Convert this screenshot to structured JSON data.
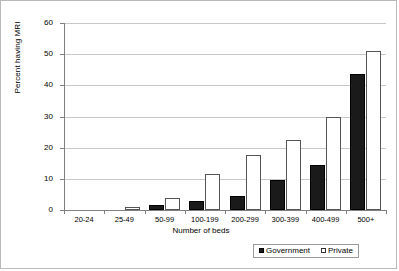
{
  "chart_data": {
    "type": "bar",
    "title": "",
    "xlabel": "Number of beds",
    "ylabel": "Percent having MRI",
    "categories": [
      "20-24",
      "25-49",
      "50-99",
      "100-199",
      "200-299",
      "300-399",
      "400-499",
      "500+"
    ],
    "series": [
      {
        "name": "Government",
        "values": [
          0,
          0,
          1.5,
          3,
          4.5,
          9.5,
          14.5,
          43.5
        ],
        "color": "#1a1a1a",
        "fill": "solid-black"
      },
      {
        "name": "Private",
        "values": [
          0,
          1,
          4,
          11.5,
          17.5,
          22.5,
          30,
          51
        ],
        "color": "#ffffff",
        "fill": "white-outlined"
      }
    ],
    "ylim": [
      0,
      60
    ],
    "yticks": [
      0,
      10,
      20,
      30,
      40,
      50,
      60
    ],
    "ytick_labels": [
      "0",
      "10",
      "20",
      "30",
      "40",
      "50",
      "60"
    ],
    "grid": "horizontal",
    "legend_position": "bottom-right",
    "legend_entries": [
      "Government",
      "Private"
    ]
  },
  "colors": {
    "government": "#1a1a1a",
    "private": "#ffffff",
    "gridline": "#c8c8c8",
    "axis": "#808080",
    "frame": "#b9b9b9"
  }
}
